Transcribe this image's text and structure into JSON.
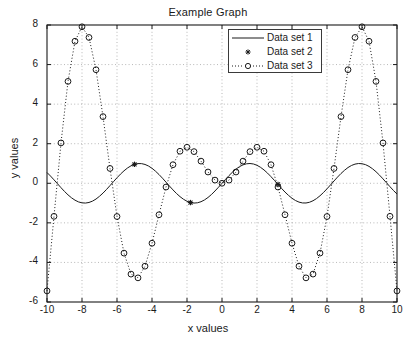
{
  "chart_data": {
    "type": "line",
    "title": "Example Graph",
    "xlabel": "x values",
    "ylabel": "y values",
    "xlim": [
      -10,
      10
    ],
    "ylim": [
      -6,
      8
    ],
    "xticks": [
      -10,
      -8,
      -6,
      -4,
      -2,
      0,
      2,
      4,
      6,
      8,
      10
    ],
    "yticks": [
      -6,
      -4,
      -2,
      0,
      2,
      4,
      6,
      8
    ],
    "xtick_labels": [
      "-10",
      "-8",
      "-6",
      "-4",
      "-2",
      "0",
      "2",
      "4",
      "6",
      "8",
      "10"
    ],
    "ytick_labels": [
      "-6",
      "-4",
      "-2",
      "0",
      "2",
      "4",
      "6",
      "8"
    ],
    "grid": true,
    "grid_style": "dotted",
    "legend_position": "top-center-right",
    "background": "#ffffff",
    "series": [
      {
        "name": "Data set 1",
        "style": "solid-line",
        "marker": "none",
        "color": "#1a1a1a",
        "formula": "sin(x)",
        "x": [
          -10,
          -9.8,
          -9.6,
          -9.4,
          -9.2,
          -9,
          -8.8,
          -8.6,
          -8.4,
          -8.2,
          -8,
          -7.8,
          -7.6,
          -7.4,
          -7.2,
          -7,
          -6.8,
          -6.6,
          -6.4,
          -6.2,
          -6,
          -5.8,
          -5.6,
          -5.4,
          -5.2,
          -5,
          -4.8,
          -4.6,
          -4.4,
          -4.2,
          -4,
          -3.8,
          -3.6,
          -3.4,
          -3.2,
          -3,
          -2.8,
          -2.6,
          -2.4,
          -2.2,
          -2,
          -1.8,
          -1.6,
          -1.4,
          -1.2,
          -1,
          -0.8,
          -0.6,
          -0.4,
          -0.2,
          0,
          0.2,
          0.4,
          0.6,
          0.8,
          1,
          1.2,
          1.4,
          1.6,
          1.8,
          2,
          2.2,
          2.4,
          2.6,
          2.8,
          3,
          3.2,
          3.4,
          3.6,
          3.8,
          4,
          4.2,
          4.4,
          4.6,
          4.8,
          5,
          5.2,
          5.4,
          5.6,
          5.8,
          6,
          6.2,
          6.4,
          6.6,
          6.8,
          7,
          7.2,
          7.4,
          7.6,
          7.8,
          8,
          8.2,
          8.4,
          8.6,
          8.8,
          9,
          9.2,
          9.4,
          9.6,
          9.8,
          10
        ],
        "y": [
          0.544,
          0.366,
          0.174,
          -0.024,
          -0.222,
          -0.412,
          -0.585,
          -0.734,
          -0.855,
          -0.942,
          -0.989,
          -0.999,
          -0.969,
          -0.901,
          -0.797,
          -0.657,
          -0.495,
          -0.312,
          -0.117,
          0.083,
          0.279,
          0.465,
          0.631,
          0.773,
          0.883,
          0.959,
          0.996,
          0.994,
          0.952,
          0.872,
          0.757,
          0.612,
          0.443,
          0.256,
          0.058,
          -0.141,
          -0.335,
          -0.516,
          -0.675,
          -0.808,
          -0.909,
          -0.974,
          -1.0,
          -0.985,
          -0.932,
          -0.841,
          -0.717,
          -0.565,
          -0.389,
          -0.199,
          0,
          0.199,
          0.389,
          0.565,
          0.717,
          0.841,
          0.932,
          0.985,
          1.0,
          0.974,
          0.909,
          0.808,
          0.675,
          0.516,
          0.335,
          0.141,
          -0.058,
          -0.256,
          -0.443,
          -0.612,
          -0.757,
          -0.872,
          -0.952,
          -0.994,
          -0.996,
          -0.959,
          -0.883,
          -0.773,
          -0.631,
          -0.465,
          -0.279,
          -0.083,
          0.117,
          0.312,
          0.495,
          0.657,
          0.797,
          0.901,
          0.969,
          0.999,
          0.989,
          0.942,
          0.855,
          0.734,
          0.585,
          0.412,
          0.222,
          0.024,
          -0.174,
          -0.366,
          -0.544
        ]
      },
      {
        "name": "Data set 2",
        "style": "markers-only",
        "marker": "star",
        "color": "#1a1a1a",
        "x": [
          -5.0,
          -1.8,
          3.2
        ],
        "y": [
          0.959,
          -0.974,
          -0.058
        ]
      },
      {
        "name": "Data set 3",
        "style": "dotted-line",
        "marker": "circle",
        "color": "#1a1a1a",
        "formula": "x * sin(x)",
        "x": [
          -10,
          -9.6,
          -9.2,
          -8.8,
          -8.4,
          -8,
          -7.6,
          -7.2,
          -6.8,
          -6.4,
          -6,
          -5.6,
          -5.2,
          -4.8,
          -4.4,
          -4,
          -3.6,
          -3.2,
          -2.8,
          -2.4,
          -2,
          -1.6,
          -1.2,
          -0.8,
          -0.4,
          0,
          0.4,
          0.8,
          1.2,
          1.6,
          2,
          2.4,
          2.8,
          3.2,
          3.6,
          4,
          4.4,
          4.8,
          5.2,
          5.6,
          6,
          6.4,
          6.8,
          7.2,
          7.6,
          8,
          8.4,
          8.8,
          9.2,
          9.6,
          10
        ],
        "y": [
          -5.44,
          -1.67,
          2.04,
          5.15,
          7.18,
          7.91,
          7.37,
          5.74,
          3.37,
          0.75,
          -1.68,
          -3.53,
          -4.59,
          -4.78,
          -4.19,
          -3.03,
          -1.59,
          -0.19,
          0.94,
          1.62,
          1.82,
          1.6,
          1.12,
          0.57,
          0.16,
          0,
          0.16,
          0.57,
          1.12,
          1.6,
          1.82,
          1.62,
          0.94,
          -0.19,
          -1.59,
          -3.03,
          -4.19,
          -4.78,
          -4.59,
          -3.53,
          -1.68,
          0.75,
          3.37,
          5.74,
          7.37,
          7.91,
          7.18,
          5.15,
          2.04,
          -1.67,
          -5.44
        ]
      }
    ]
  },
  "legend": {
    "entries": [
      {
        "label": "Data set 1",
        "symbol": "line"
      },
      {
        "label": "Data set 2",
        "symbol": "star"
      },
      {
        "label": "Data set 3",
        "symbol": "dotted-circle"
      }
    ]
  }
}
